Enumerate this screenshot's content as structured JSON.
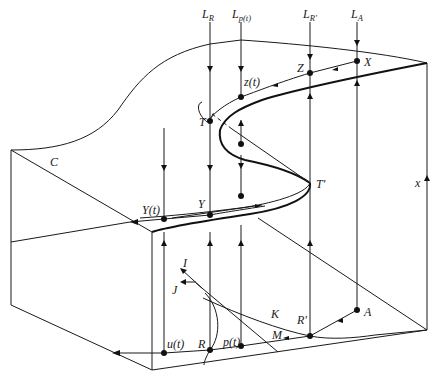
{
  "figure": {
    "type": "catastrophe-surface-diagram",
    "labels": {
      "L_R": {
        "main": "L",
        "sub": "R"
      },
      "L_pt": {
        "main": "L",
        "sub": "p(t)"
      },
      "L_Rp": {
        "main": "L",
        "sub": "R'"
      },
      "L_A": {
        "main": "L",
        "sub": "A"
      },
      "z_t": "z(t)",
      "Z": "Z",
      "X": "X",
      "T": "T",
      "T_prime": "T'",
      "C": "C",
      "x_axis": "x",
      "Y_t": "Y(t)",
      "Y": "Y",
      "I": "I",
      "J": "J",
      "K": "K",
      "R_prime": "R'",
      "A": "A",
      "M": "M",
      "u_t": "u(t)",
      "R": "R",
      "p_t": "p(t)"
    }
  }
}
